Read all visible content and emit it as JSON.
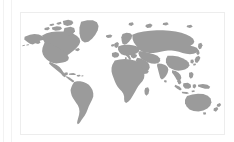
{
  "page": {
    "background_color": "#ffffff",
    "width": 234,
    "height": 142
  },
  "gutter": {
    "rule_color": "#f2f2f2",
    "outer_rule_label": "page-gutter-rule-outer",
    "inner_rule_label": "page-gutter-rule-inner"
  },
  "card": {
    "border_color": "#ededed",
    "background_color": "#ffffff",
    "title": "",
    "caption": ""
  },
  "map": {
    "type": "world-map",
    "projection": "equirectangular",
    "land_color": "#9b9b9b",
    "ocean_color": "#ffffff",
    "alt_text": "World map with grey landmasses on a white ocean",
    "includes_antarctica": false,
    "regions": [
      "North America",
      "Greenland",
      "Canadian Arctic Archipelago",
      "Central America",
      "Caribbean",
      "South America",
      "Europe",
      "Scandinavia",
      "British Isles",
      "Iceland",
      "Africa",
      "Madagascar",
      "Middle East",
      "Russia / Northern Asia",
      "Central Asia",
      "India",
      "Sri Lanka",
      "China",
      "Japan",
      "Southeast Asia",
      "Indonesia",
      "Philippines",
      "New Guinea",
      "Australia",
      "New Zealand"
    ]
  }
}
